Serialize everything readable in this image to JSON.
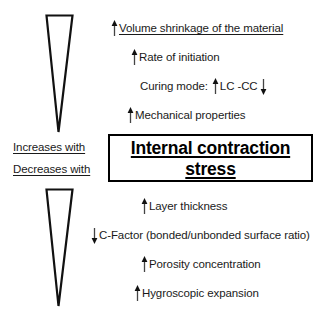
{
  "diagram": {
    "title": "Internal contraction stress",
    "center_box": {
      "line1": "Internal contraction",
      "line2": "stress",
      "border_color": "#000000",
      "text_color": "#000000"
    },
    "side_labels": {
      "increases": "Increases with",
      "decreases": "Decreases with"
    },
    "ink_color": "#1a1a1a",
    "background": "#ffffff",
    "factors_above": [
      {
        "label": "Volume shrinkage of the material",
        "arrow": "up",
        "underline": true,
        "extra_arrow": null,
        "extra_label": null
      },
      {
        "label": "Rate of initiation",
        "arrow": "up",
        "underline": false,
        "extra_arrow": null,
        "extra_label": null
      },
      {
        "label": "Curing mode:",
        "arrow": "none",
        "underline": false,
        "extra_arrow": "up",
        "extra_label": "LC -CC",
        "trailing_arrow": "down"
      },
      {
        "label": "Mechanical properties",
        "arrow": "up",
        "underline": false,
        "extra_arrow": null,
        "extra_label": null
      }
    ],
    "factors_below": [
      {
        "label": "Layer thickness",
        "arrow": "up",
        "underline": false
      },
      {
        "label": "C-Factor (bonded/unbonded surface ratio)",
        "arrow": "down",
        "underline": false
      },
      {
        "label": "Porosity concentration",
        "arrow": "up",
        "underline": false
      },
      {
        "label": "Hygroscopic expansion",
        "arrow": "up",
        "underline": false
      }
    ],
    "wedges": [
      {
        "name": "upper-wedge",
        "orientation": "tapering-down"
      },
      {
        "name": "lower-wedge",
        "orientation": "tapering-down"
      }
    ]
  }
}
